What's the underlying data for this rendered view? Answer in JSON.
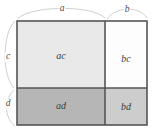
{
  "figure": {
    "background_color": "#ffffff",
    "stroke_color": "#555555",
    "brace_color": "#c8c8c8",
    "text_color": "#3a3a3a"
  },
  "dimensions": {
    "top": [
      {
        "id": "a",
        "label": "a",
        "segment": "left-width",
        "x": 62,
        "y": 9
      },
      {
        "id": "b",
        "label": "b",
        "segment": "right-width",
        "x": 127,
        "y": 10
      }
    ],
    "left": [
      {
        "id": "c",
        "label": "c",
        "segment": "top-height",
        "x": 8,
        "y": 57
      },
      {
        "id": "d",
        "label": "d",
        "segment": "bottom-height",
        "x": 8,
        "y": 104
      }
    ]
  },
  "regions": [
    {
      "id": "ac",
      "label": "ac",
      "fill": "#e9e9e9",
      "x": 17,
      "y": 21,
      "w": 88,
      "h": 67,
      "cx": 61,
      "cy": 56
    },
    {
      "id": "bc",
      "label": "bc",
      "fill": "#fdfdfd",
      "x": 105,
      "y": 21,
      "w": 42,
      "h": 67,
      "cx": 126,
      "cy": 59
    },
    {
      "id": "ad",
      "label": "ad",
      "fill": "#b6b6b6",
      "x": 17,
      "y": 88,
      "w": 88,
      "h": 37,
      "cx": 61,
      "cy": 106
    },
    {
      "id": "bd",
      "label": "bd",
      "fill": "#cdcdcd",
      "x": 105,
      "y": 88,
      "w": 42,
      "h": 37,
      "cx": 126,
      "cy": 107
    }
  ],
  "geometry": {
    "left": 17,
    "right": 147,
    "top": 21,
    "bottom": 125,
    "v_divider": 105,
    "h_divider": 88
  },
  "braces": {
    "a_path": "M 17,19 C 30,6 95,6 105,18",
    "b_path": "M 107,19 C 115,7 142,7 147,18",
    "c_path": "M 15,21 C 3,34 3,76 14,88",
    "d_path": "M 14,90 C 5,100 5,118 15,125"
  }
}
